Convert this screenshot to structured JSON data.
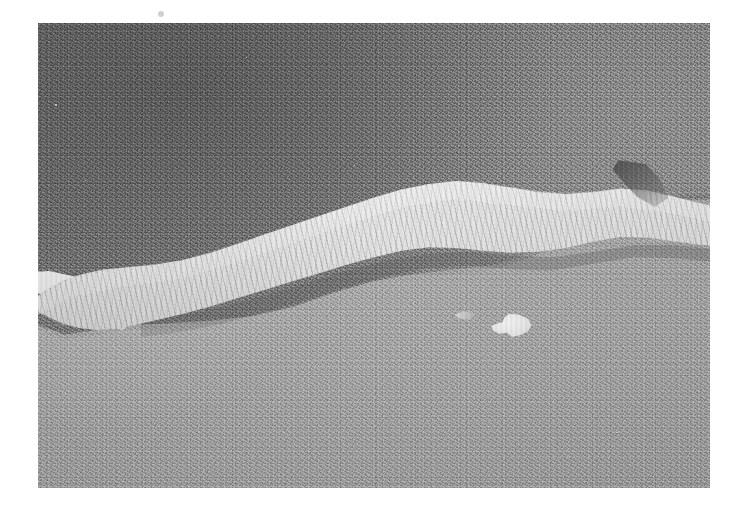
{
  "page": {
    "width": 746,
    "height": 514,
    "background_color": "#ffffff",
    "type": "scientific-micrograph-print"
  },
  "micrograph": {
    "label": "sem-micrograph",
    "x": 38,
    "y": 23,
    "width": 672,
    "height": 465,
    "modality": "Scanning electron micrograph",
    "palette": {
      "upper_substrate": "#7c7c7c",
      "lower_substrate": "#a8a8a8",
      "fiber_band_highlight": "#f2f2f2",
      "fiber_band_midtone": "#d4d4d4",
      "shadow": "#3c3c3c",
      "debris_particle": "#f0f0f0",
      "print_margin": "#ffffff"
    },
    "regions": [
      {
        "name": "upper-substrate",
        "description": "Darker grey granular surface occupying the upper portion of the frame",
        "tone": "#7c7c7c",
        "texture": "fine mottled granular"
      },
      {
        "name": "lower-substrate",
        "description": "Lighter grey granular surface occupying the lower portion of the frame",
        "tone": "#a8a8a8",
        "texture": "fine mottled granular"
      },
      {
        "name": "fibrous-band",
        "description": "Bright elongated fibrous band with transverse wrinkle striations running left to right across the frame",
        "tone": "#eeeeee",
        "texture": "transverse wrinkled striations"
      },
      {
        "name": "undercut-shadow",
        "description": "Dark shadow line beneath the fibrous band",
        "tone": "#3c3c3c"
      },
      {
        "name": "right-notch",
        "description": "Dark notch where the band narrows and branches near the right edge",
        "tone": "#5a5a5a"
      }
    ],
    "features": [
      {
        "name": "debris-particle-large",
        "description": "Bright irregular debris particle on lower substrate",
        "x_pct": 70.8,
        "y_pct": 65.6
      },
      {
        "name": "debris-particle-tail",
        "description": "Small bright fleck left of the large particle",
        "x_pct": 63.6,
        "y_pct": 62.9
      },
      {
        "name": "speck-upper-left-1",
        "description": "Bright speck on upper substrate near left edge",
        "x_pct": 2.5,
        "y_pct": 17.5
      },
      {
        "name": "speck-upper-left-2",
        "description": "Bright speck on upper substrate",
        "x_pct": 7.0,
        "y_pct": 33.8
      },
      {
        "name": "speck-upper-mid",
        "description": "Bright speck in upper mid field",
        "x_pct": 31.0,
        "y_pct": 7.3
      },
      {
        "name": "speck-upper-right",
        "description": "Bright speck upper right of field",
        "x_pct": 69.5,
        "y_pct": 11.6
      },
      {
        "name": "speck-upper-right-2",
        "description": "Bright speck right of centre top",
        "x_pct": 47.0,
        "y_pct": 30.5
      },
      {
        "name": "speck-lower-left",
        "description": "Bright speck on lower substrate near left",
        "x_pct": 4.0,
        "y_pct": 79.6
      },
      {
        "name": "speck-lower-right-1",
        "description": "Bright speck lower right",
        "x_pct": 86.0,
        "y_pct": 88.0
      },
      {
        "name": "speck-lower-right-2",
        "description": "Bright speck lower right",
        "x_pct": 91.5,
        "y_pct": 91.4
      },
      {
        "name": "speck-lower-right-3",
        "description": "Bright speck lower right",
        "x_pct": 79.0,
        "y_pct": 93.2
      },
      {
        "name": "speck-lower-centre",
        "description": "Bright fleck lower centre",
        "x_pct": 51.0,
        "y_pct": 84.0
      }
    ]
  },
  "margin": {
    "name": "print-margin",
    "color": "#ffffff",
    "mark": {
      "name": "faint-margin-mark",
      "x": 158,
      "y": 11
    }
  },
  "overlay_text": {
    "present": false,
    "scale_bar": null,
    "magnification": null,
    "caption": null
  }
}
